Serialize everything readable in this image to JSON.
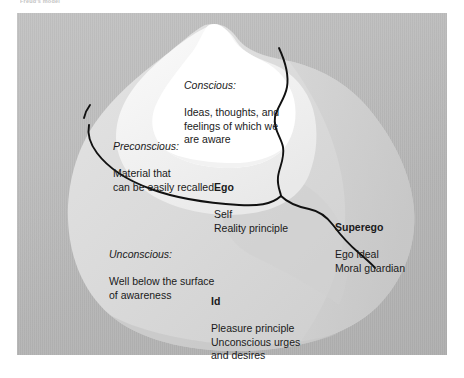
{
  "figure": {
    "top_caption": "Freud's model",
    "panel_color": "#b8b8b8",
    "line_color": "#000000",
    "text_color": "#1a1a1a",
    "iceberg": {
      "conscious_fill": "#ffffff",
      "preconscious_fill": "#ededed",
      "unconscious_fill": "#d8d8d8"
    }
  },
  "labels": {
    "conscious": {
      "heading": "Conscious:",
      "body": "Ideas, thoughts, and\nfeelings of which we\nare aware",
      "style": "italic-heading"
    },
    "preconscious": {
      "heading": "Preconscious:",
      "body": "Material that\ncan be easily recalled",
      "style": "italic-heading"
    },
    "ego": {
      "heading": "Ego",
      "body": "Self\nReality principle",
      "style": "bold-heading"
    },
    "superego": {
      "heading": "Superego",
      "body": "Ego ideal\nMoral guardian",
      "style": "bold-heading"
    },
    "unconscious": {
      "heading": "Unconscious:",
      "body": "Well below the surface\nof awareness",
      "style": "italic-heading"
    },
    "id": {
      "heading": "Id",
      "body": "Pleasure principle\nUnconscious urges\nand desires",
      "style": "bold-heading"
    }
  }
}
